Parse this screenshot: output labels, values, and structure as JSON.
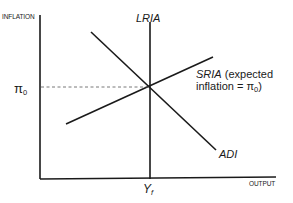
{
  "diagram": {
    "y_axis_label": "INFLATION",
    "x_axis_label": "OUTPUT",
    "pi_label": "π",
    "pi_subscript": "0",
    "yf_label": "Y",
    "yf_subscript": "f",
    "lria_label": "LRIA",
    "sria_label": "SRIA",
    "sria_note_line1": " (expected",
    "sria_note_line2_prefix": "inflation = π",
    "sria_note_line2_sub": "0",
    "sria_note_line2_suffix": ")",
    "adi_label": "ADI",
    "colors": {
      "line": "#1a1a1a",
      "dashed": "#555555",
      "background": "#ffffff"
    }
  }
}
